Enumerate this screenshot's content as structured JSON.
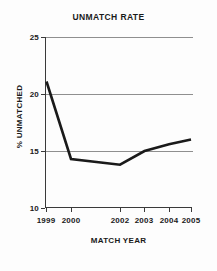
{
  "chart_data": {
    "type": "line",
    "title": "UNMATCH RATE",
    "xlabel": "MATCH YEAR",
    "ylabel": "% UNMATCHED",
    "categories": [
      "1999",
      "2000",
      "2002",
      "2003",
      "2004",
      "2005"
    ],
    "values": [
      21.1,
      14.3,
      13.8,
      15.0,
      15.6,
      16.0
    ],
    "series": [
      {
        "name": "% Unmatched",
        "values": [
          21.1,
          14.3,
          13.8,
          15.0,
          15.6,
          16.0
        ]
      }
    ],
    "ylim": [
      10,
      25
    ],
    "yticks": [
      10,
      15,
      20,
      25
    ],
    "ytick_labels": [
      "10",
      "15",
      "20",
      "25"
    ],
    "xticks": [
      "1999",
      "2000",
      "2002",
      "2003",
      "2004",
      "2005"
    ],
    "grid": true,
    "gridlines_at": [
      15,
      20,
      25
    ],
    "legend": "none",
    "line_color": "#1a1a1a",
    "grid_color": "#8f8f8f",
    "axis_color": "#3a3a3a",
    "background_color": "#fdfdfd"
  },
  "axes": {
    "y_labels": [
      "25",
      "20",
      "15",
      "10"
    ],
    "x_labels": [
      "1999",
      "2000",
      "2002",
      "2003",
      "2004",
      "2005"
    ]
  }
}
